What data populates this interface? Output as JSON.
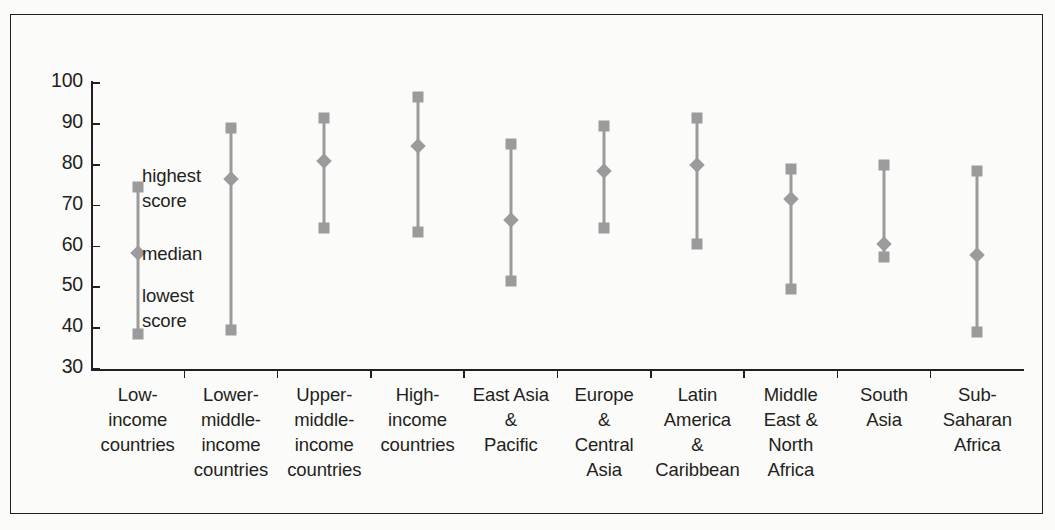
{
  "chart_data": {
    "type": "scatter",
    "title": "",
    "xlabel": "",
    "ylabel": "",
    "ylim": [
      30,
      100
    ],
    "grid": false,
    "legend_position": "in-plot annotations",
    "y_ticks": [
      100,
      90,
      80,
      70,
      60,
      50,
      40,
      30
    ],
    "annotations": [
      {
        "name": "highest-score",
        "text": "highest\nscore",
        "line1": "highest",
        "line2": "score"
      },
      {
        "name": "median",
        "text": "median",
        "line1": "median",
        "line2": ""
      },
      {
        "name": "lowest-score",
        "text": "lowest\nscore",
        "line1": "lowest",
        "line2": "score"
      }
    ],
    "marker_color": "#9b9b9b",
    "categories": [
      "Low-\nincome\ncountries",
      "Lower-\nmiddle-\nincome\ncountries",
      "Upper-\nmiddle-\nincome\ncountries",
      "High-\nincome\ncountries",
      "East Asia\n&\nPacific",
      "Europe\n&\nCentral\nAsia",
      "Latin\nAmerica\n&\nCaribbean",
      "Middle\nEast &\nNorth\nAfrica",
      "South\nAsia",
      "Sub-Saharan\nAfrica"
    ],
    "series": [
      {
        "name": "highest score",
        "values": [
          74.5,
          89.0,
          91.5,
          96.5,
          85.0,
          89.5,
          91.5,
          79.0,
          80.0,
          78.5
        ]
      },
      {
        "name": "median",
        "values": [
          58.5,
          76.5,
          81.0,
          84.5,
          66.5,
          78.5,
          80.0,
          71.5,
          60.5,
          58.0
        ]
      },
      {
        "name": "lowest score",
        "values": [
          38.5,
          39.5,
          64.5,
          63.5,
          51.5,
          64.5,
          60.5,
          49.5,
          57.5,
          39.0
        ]
      }
    ]
  },
  "categories_display": [
    {
      "lines": [
        "Low-",
        "income",
        "countries"
      ]
    },
    {
      "lines": [
        "Lower-",
        "middle-",
        "income",
        "countries"
      ]
    },
    {
      "lines": [
        "Upper-",
        "middle-",
        "income",
        "countries"
      ]
    },
    {
      "lines": [
        "High-",
        "income",
        "countries"
      ]
    },
    {
      "lines": [
        "East Asia",
        "&",
        "Pacific"
      ]
    },
    {
      "lines": [
        "Europe",
        "&",
        "Central",
        "Asia"
      ]
    },
    {
      "lines": [
        "Latin",
        "America",
        "&",
        "Caribbean"
      ]
    },
    {
      "lines": [
        "Middle",
        "East &",
        "North",
        "Africa"
      ]
    },
    {
      "lines": [
        "South",
        "Asia"
      ]
    },
    {
      "lines": [
        "Sub-Saharan",
        "Africa"
      ]
    }
  ],
  "annotation_labels": {
    "highest_line1": "highest",
    "highest_line2": "score",
    "median_line1": "median",
    "lowest_line1": "lowest",
    "lowest_line2": "score"
  },
  "colors": {
    "marker": "#9b9b9b",
    "axis": "#231f20",
    "frame": "#231f20",
    "background": "#fbfbf9"
  }
}
